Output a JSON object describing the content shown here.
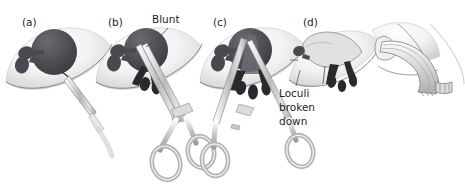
{
  "figure": {
    "panel_count": 5,
    "palette": {
      "abscess_dark": "#4a474f",
      "abscess_mid": "#5d5a62",
      "skin_light": "#f2f0f0",
      "skin_shadow": "#d9d6d6",
      "instrument_gray": "#b8b5b5",
      "instrument_light": "#e6e4e4",
      "outline": "#6f6c6c",
      "text": "#231f20",
      "background": "#ffffff"
    },
    "panels": [
      {
        "id": "panel-a",
        "label": "(a)",
        "caption": "",
        "description": "Scalpel incision over fluctuant abscess"
      },
      {
        "id": "panel-b",
        "label": "(b)",
        "caption": "Blunt",
        "description": "Blunt forceps introduced into abscess cavity"
      },
      {
        "id": "panel-c",
        "label": "(c)",
        "caption": "",
        "description": "Forceps opened to break down loculi"
      },
      {
        "id": "panel-d",
        "label": "(d)",
        "caption": "Loculi broken down",
        "description": "Collapsed cavity after loculi broken down"
      },
      {
        "id": "panel-e",
        "label": "",
        "caption": "",
        "description": "Corrugated drain placed in wound"
      }
    ],
    "annotations": [
      {
        "id": "blunt-callout",
        "text": "Blunt",
        "panel": "(b)"
      },
      {
        "id": "loculi-callout",
        "text": "Loculi broken down",
        "panel": "(d)"
      }
    ]
  }
}
